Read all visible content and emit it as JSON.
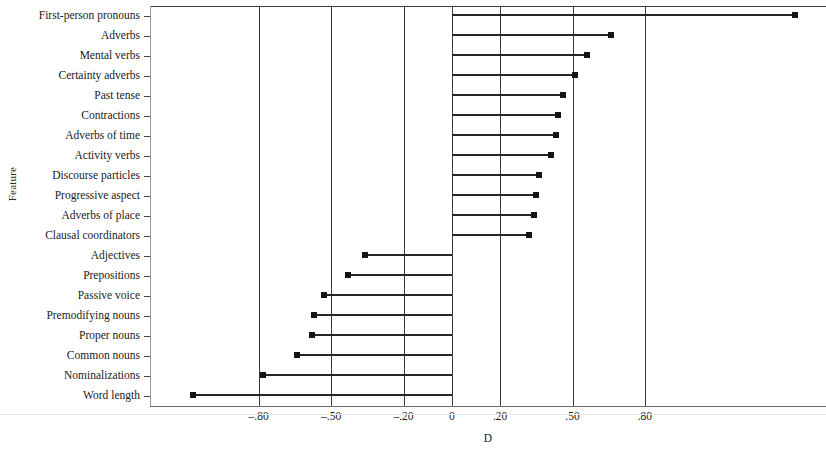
{
  "chart_data": {
    "type": "bar",
    "orientation": "horizontal",
    "title": "",
    "subtitle": "",
    "xlabel": "D",
    "ylabel": "Feature",
    "xlim": [
      -1.25,
      1.55
    ],
    "xticks": [
      -0.8,
      -0.5,
      -0.2,
      0,
      0.2,
      0.5,
      0.8
    ],
    "xticklabels": [
      "–.80",
      "–.50",
      "–.20",
      "0",
      ".20",
      ".50",
      ".80"
    ],
    "gridlines_x": [
      -0.8,
      -0.5,
      -0.2,
      0,
      0.2,
      0.5,
      0.8
    ],
    "grid": true,
    "legend": null,
    "baseline": 0,
    "categories": [
      "First-person pronouns",
      "Adverbs",
      "Mental verbs",
      "Certainty adverbs",
      "Past tense",
      "Contractions",
      "Adverbs of time",
      "Activity verbs",
      "Discourse particles",
      "Progressive aspect",
      "Adverbs of place",
      "Clausal coordinators",
      "Adjectives",
      "Prepositions",
      "Passive voice",
      "Premodifying nouns",
      "Proper nouns",
      "Common nouns",
      "Nominalizations",
      "Word length"
    ],
    "values": [
      1.42,
      0.66,
      0.56,
      0.51,
      0.46,
      0.44,
      0.43,
      0.41,
      0.36,
      0.35,
      0.34,
      0.32,
      -0.36,
      -0.43,
      -0.53,
      -0.57,
      -0.58,
      -0.64,
      -0.78,
      -1.07
    ],
    "marker": "square",
    "marker_color": "#151515",
    "line_color": "#262626"
  }
}
